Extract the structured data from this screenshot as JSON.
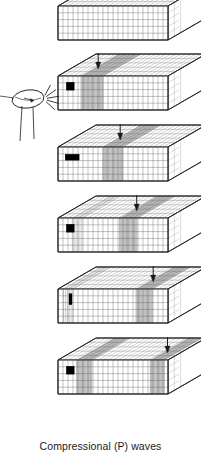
{
  "figure": {
    "caption": "Compressional (P) waves",
    "title": "Compressional (P) waves",
    "wave_type": "P",
    "wave_name": "Compressional",
    "frame_count": 6,
    "source_label": "hammer",
    "colors": {
      "outline": "#1a1a1a",
      "grid": "#555555",
      "compression_band": "#3a3a3a",
      "marker": "#000000",
      "top_face": "#ffffff",
      "front_face": "#ffffff",
      "side_face": "#ffffff",
      "background": "#ffffff"
    },
    "block_geometry": {
      "front_width": 110,
      "front_height": 34,
      "depth_x": 38,
      "depth_y": -22,
      "grid_cols": 22,
      "grid_rows": 5,
      "top_rows": 5
    },
    "frames": [
      {
        "index": 1,
        "label": "undisturbed-block",
        "description": "Undeformed block with uniform grid, no wave present",
        "y": 6,
        "has_hammer": false,
        "arrow": null,
        "marker": null,
        "bands": []
      },
      {
        "index": 2,
        "label": "impact-frame",
        "description": "Hammer strikes left end; compression band forms at left; arrow marks wavefront",
        "y": 76,
        "has_hammer": true,
        "arrow": {
          "x_frac": 0.21,
          "label": "wavefront-arrow"
        },
        "marker": {
          "x_frac": 0.075,
          "row": 1,
          "w": 8,
          "h": 8,
          "shape": "square"
        },
        "bands": [
          {
            "x_frac": 0.21,
            "width_frac": 0.2,
            "density": "high"
          }
        ]
      },
      {
        "index": 3,
        "label": "wave-advancing-frame",
        "description": "Wavefront advances right; particle marker stretched horizontally in dilation zone",
        "y": 147,
        "has_hammer": false,
        "arrow": {
          "x_frac": 0.41,
          "label": "wavefront-arrow"
        },
        "marker": {
          "x_frac": 0.065,
          "row": 1,
          "w": 14,
          "h": 6,
          "shape": "wide"
        },
        "bands": [
          {
            "x_frac": 0.41,
            "width_frac": 0.18,
            "density": "high"
          }
        ]
      },
      {
        "index": 4,
        "label": "wave-midblock-frame",
        "description": "Wavefront near middle; marker returns toward square as compression passes",
        "y": 218,
        "has_hammer": false,
        "arrow": {
          "x_frac": 0.56,
          "label": "wavefront-arrow"
        },
        "marker": {
          "x_frac": 0.075,
          "row": 1,
          "w": 8,
          "h": 8,
          "shape": "square"
        },
        "bands": [
          {
            "x_frac": 0.56,
            "width_frac": 0.16,
            "density": "high"
          },
          {
            "x_frac": 0.13,
            "width_frac": 0.1,
            "density": "medium"
          }
        ]
      },
      {
        "index": 5,
        "label": "wave-three-quarter-frame",
        "description": "Wavefront at three quarters; marker compressed into narrow vertical bar",
        "y": 289,
        "has_hammer": false,
        "arrow": {
          "x_frac": 0.71,
          "label": "wavefront-arrow"
        },
        "marker": {
          "x_frac": 0.1,
          "row": 1,
          "w": 3,
          "h": 11,
          "shape": "narrow"
        },
        "bands": [
          {
            "x_frac": 0.71,
            "width_frac": 0.15,
            "density": "high"
          },
          {
            "x_frac": 0.05,
            "width_frac": 0.09,
            "density": "medium"
          }
        ]
      },
      {
        "index": 6,
        "label": "wave-exiting-frame",
        "description": "Wavefront reaches right end; new compression band at left as next cycle begins",
        "y": 360,
        "has_hammer": false,
        "arrow": {
          "x_frac": 0.84,
          "label": "wavefront-arrow"
        },
        "marker": {
          "x_frac": 0.075,
          "row": 1,
          "w": 8,
          "h": 8,
          "shape": "square"
        },
        "bands": [
          {
            "x_frac": 0.84,
            "width_frac": 0.13,
            "density": "high"
          },
          {
            "x_frac": 0.17,
            "width_frac": 0.14,
            "density": "high"
          }
        ]
      }
    ],
    "hammer": {
      "label": "hammer-striking-block",
      "head_cx": 28,
      "head_cy": 99,
      "head_rx": 16,
      "head_ry": 9,
      "impact_lines": 5
    }
  }
}
